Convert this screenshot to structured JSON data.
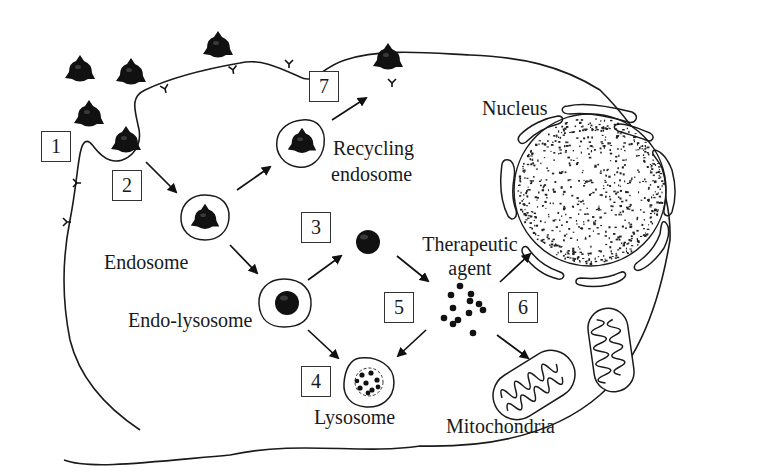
{
  "diagram": {
    "type": "cell-pathway-diagram",
    "colors": {
      "line": "#1a1a1a",
      "fill": "#111111",
      "background": "#ffffff"
    }
  },
  "steps": [
    {
      "id": "1",
      "label": "1"
    },
    {
      "id": "2",
      "label": "2"
    },
    {
      "id": "3",
      "label": "3"
    },
    {
      "id": "4",
      "label": "4"
    },
    {
      "id": "5",
      "label": "5"
    },
    {
      "id": "6",
      "label": "6"
    },
    {
      "id": "7",
      "label": "7"
    }
  ],
  "labels": {
    "recycling_endosome_line1": "Recycling",
    "recycling_endosome_line2": "endosome",
    "nucleus": "Nucleus",
    "endosome": "Endosome",
    "endo_lysosome": "Endo-lysosome",
    "therapeutic_agent_line1": "Therapeutic",
    "therapeutic_agent_line2": "agent",
    "lysosome": "Lysosome",
    "mitochondria": "Mitochondria"
  },
  "pathway": [
    {
      "from": "cell-membrane",
      "to": "endosome",
      "step": "2"
    },
    {
      "from": "endosome",
      "to": "recycling-endosome"
    },
    {
      "from": "recycling-endosome",
      "to": "extracellular",
      "step": "7"
    },
    {
      "from": "endosome",
      "to": "endo-lysosome"
    },
    {
      "from": "endo-lysosome",
      "to": "released-particle",
      "step": "3"
    },
    {
      "from": "endo-lysosome",
      "to": "lysosome",
      "step": "4"
    },
    {
      "from": "released-particle",
      "to": "therapeutic-agent"
    },
    {
      "from": "therapeutic-agent",
      "to": "lysosome",
      "step": "5"
    },
    {
      "from": "therapeutic-agent",
      "to": "nucleus",
      "step": "6"
    },
    {
      "from": "therapeutic-agent",
      "to": "mitochondria",
      "step": "6"
    }
  ]
}
